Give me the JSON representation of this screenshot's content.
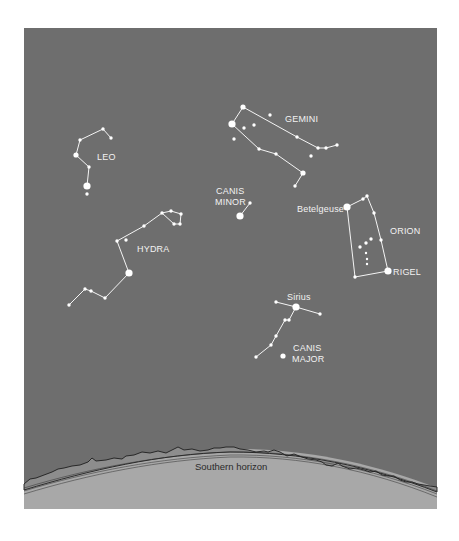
{
  "colors": {
    "sky": "#6e6e6e",
    "ground": "#a8a8a8",
    "stars": "#ffffff",
    "lines": "#f4f4f4",
    "horizon_line": "#1e1e1e"
  },
  "horizon": {
    "label": "Southern horizon"
  },
  "constellations": [
    {
      "id": "leo",
      "labels": [
        "LEO"
      ],
      "stars": [
        {
          "id": "leo-1",
          "mag": "small"
        },
        {
          "id": "leo-2",
          "mag": "small"
        },
        {
          "id": "leo-3",
          "mag": "small"
        },
        {
          "id": "leo-4",
          "mag": "medium"
        },
        {
          "id": "leo-5",
          "mag": "small"
        },
        {
          "id": "leo-regulus",
          "mag": "large"
        },
        {
          "id": "leo-7",
          "mag": "small"
        }
      ]
    },
    {
      "id": "gemini",
      "labels": [
        "GEMINI"
      ],
      "stars": [
        {
          "id": "gem-castor",
          "mag": "medium"
        },
        {
          "id": "gem-pollux",
          "mag": "large"
        },
        {
          "id": "gem-3",
          "mag": "small"
        },
        {
          "id": "gem-4",
          "mag": "small"
        },
        {
          "id": "gem-5",
          "mag": "small"
        },
        {
          "id": "gem-6",
          "mag": "small"
        },
        {
          "id": "gem-7",
          "mag": "small"
        },
        {
          "id": "gem-8",
          "mag": "small"
        },
        {
          "id": "gem-9",
          "mag": "small"
        },
        {
          "id": "gem-10",
          "mag": "small"
        },
        {
          "id": "gem-11",
          "mag": "small"
        },
        {
          "id": "gem-12",
          "mag": "small"
        },
        {
          "id": "gem-13",
          "mag": "small"
        },
        {
          "id": "gem-14",
          "mag": "medium"
        },
        {
          "id": "gem-15",
          "mag": "small"
        }
      ]
    },
    {
      "id": "canis-minor",
      "labels": [
        "CANIS",
        "MINOR"
      ],
      "stars": [
        {
          "id": "cmi-procyon",
          "mag": "large"
        },
        {
          "id": "cmi-2",
          "mag": "small"
        }
      ]
    },
    {
      "id": "hydra",
      "labels": [
        "HYDRA"
      ],
      "stars": [
        {
          "id": "hya-1",
          "mag": "small"
        },
        {
          "id": "hya-2",
          "mag": "small"
        },
        {
          "id": "hya-3",
          "mag": "small"
        },
        {
          "id": "hya-4",
          "mag": "small"
        },
        {
          "id": "hya-alphard",
          "mag": "large"
        },
        {
          "id": "hya-6",
          "mag": "small"
        },
        {
          "id": "hya-7",
          "mag": "small"
        },
        {
          "id": "hya-8",
          "mag": "small"
        },
        {
          "id": "hya-9",
          "mag": "small"
        },
        {
          "id": "hya-10",
          "mag": "small"
        },
        {
          "id": "hya-11",
          "mag": "small"
        },
        {
          "id": "hya-12",
          "mag": "small"
        },
        {
          "id": "hya-13",
          "mag": "small"
        }
      ]
    },
    {
      "id": "orion",
      "labels": [
        "ORION"
      ],
      "stars": [
        {
          "id": "ori-betelgeuse",
          "mag": "large",
          "label": "Betelgeuse"
        },
        {
          "id": "ori-2",
          "mag": "small"
        },
        {
          "id": "ori-3",
          "mag": "small"
        },
        {
          "id": "ori-4",
          "mag": "small"
        },
        {
          "id": "ori-5",
          "mag": "small"
        },
        {
          "id": "ori-rigel",
          "mag": "large",
          "label": "RIGEL"
        },
        {
          "id": "ori-7",
          "mag": "small"
        },
        {
          "id": "ori-belt-1",
          "mag": "small"
        },
        {
          "id": "ori-belt-2",
          "mag": "small"
        },
        {
          "id": "ori-belt-3",
          "mag": "small"
        },
        {
          "id": "ori-sword-1",
          "mag": "tiny"
        },
        {
          "id": "ori-sword-2",
          "mag": "tiny"
        },
        {
          "id": "ori-sword-3",
          "mag": "tiny"
        }
      ]
    },
    {
      "id": "canis-major",
      "labels": [
        "CANIS",
        "MAJOR"
      ],
      "stars": [
        {
          "id": "cma-1",
          "mag": "small"
        },
        {
          "id": "cma-sirius",
          "mag": "large",
          "label": "Sirius"
        },
        {
          "id": "cma-3",
          "mag": "small"
        },
        {
          "id": "cma-4",
          "mag": "small"
        },
        {
          "id": "cma-5",
          "mag": "small"
        },
        {
          "id": "cma-6",
          "mag": "small"
        },
        {
          "id": "cma-7",
          "mag": "small"
        },
        {
          "id": "cma-8",
          "mag": "small"
        },
        {
          "id": "cma-9",
          "mag": "medium"
        }
      ]
    }
  ],
  "star_labels": {
    "betelgeuse": "Betelgeuse",
    "rigel": "RIGEL",
    "sirius": "Sirius"
  },
  "constellation_labels": {
    "leo": "LEO",
    "gemini": "GEMINI",
    "canis_minor_1": "CANIS",
    "canis_minor_2": "MINOR",
    "hydra": "HYDRA",
    "orion": "ORION",
    "canis_major_1": "CANIS",
    "canis_major_2": "MAJOR"
  }
}
